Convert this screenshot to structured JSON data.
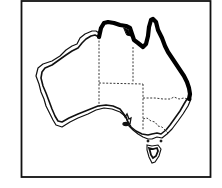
{
  "map": {
    "subject": "Australia",
    "description": "Distribution map of Australia with state borders (dashed); heavy black band along northern and eastern (Queensland/NT) coast, thin double outline along remaining coastline",
    "colors": {
      "background": "#ffffff",
      "frame": "#111111",
      "coastline": "#111111",
      "distribution_band": "#000000",
      "state_border": "#222222"
    },
    "legend": []
  }
}
